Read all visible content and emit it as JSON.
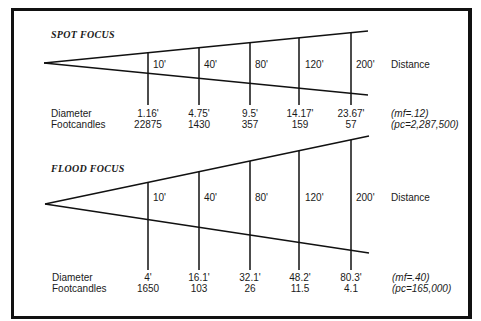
{
  "sections": [
    {
      "title": "SPOT FOCUS",
      "distances": [
        "10'",
        "40'",
        "80'",
        "120'",
        "200'"
      ],
      "distance_label": "Distance",
      "row_labels": {
        "diameter": "Diameter",
        "footcandles": "Footcandles"
      },
      "diameters": [
        "1.16'",
        "4.75'",
        "9.5'",
        "14.17'",
        "23.67'"
      ],
      "footcandles": [
        "22875",
        "1430",
        "357",
        "159",
        "57"
      ],
      "mf": "(mf=.12)",
      "pc": "(pc=2,287,500)"
    },
    {
      "title": "FLOOD FOCUS",
      "distances": [
        "10'",
        "40'",
        "80'",
        "120'",
        "200'"
      ],
      "distance_label": "Distance",
      "row_labels": {
        "diameter": "Diameter",
        "footcandles": "Footcandles"
      },
      "diameters": [
        "4'",
        "16.1'",
        "32.1'",
        "48.2'",
        "80.3'"
      ],
      "footcandles": [
        "1650",
        "103",
        "26",
        "11.5",
        "4.1"
      ],
      "mf": "(mf=.40)",
      "pc": "(pc=165,000)"
    }
  ]
}
